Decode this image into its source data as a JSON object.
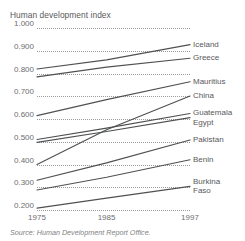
{
  "chart_data": {
    "type": "line",
    "title": "Human development index",
    "xlabel": "",
    "ylabel": "",
    "x": [
      1975,
      1985,
      1997
    ],
    "tick_labels_x": [
      "1975",
      "1985",
      "1997"
    ],
    "tick_labels_y": [
      "1.000",
      "0.900",
      "0.800",
      "0.700",
      "0.600",
      "0.500",
      "0.400",
      "0.300",
      "0.200"
    ],
    "ylim": [
      0.2,
      1.0
    ],
    "xlim": [
      1975,
      1997
    ],
    "grid": "horizontal-dotted",
    "legend_position": "right-inline-labels",
    "line_color": "#4f5052",
    "grid_color": "#9b9b9b",
    "text_color": "#58595b",
    "series": [
      {
        "name": "Iceland",
        "values": [
          0.82,
          0.86,
          0.927
        ]
      },
      {
        "name": "Greece",
        "values": [
          0.785,
          0.828,
          0.867
        ]
      },
      {
        "name": "Mauritius",
        "values": [
          0.615,
          0.685,
          0.764
        ]
      },
      {
        "name": "China",
        "values": [
          0.4,
          0.553,
          0.701
        ]
      },
      {
        "name": "Guatemala",
        "values": [
          0.51,
          0.56,
          0.624
        ]
      },
      {
        "name": "Egypt",
        "values": [
          0.497,
          0.545,
          0.606
        ]
      },
      {
        "name": "Pakistan",
        "values": [
          0.331,
          0.407,
          0.508
        ]
      },
      {
        "name": "Benin",
        "values": [
          0.288,
          0.344,
          0.421
        ]
      },
      {
        "name": "Burkina Faso",
        "values": [
          0.208,
          0.252,
          0.304
        ]
      }
    ]
  },
  "source": {
    "text": "Source: Human Development Report Office."
  },
  "series_labels": [
    {
      "lines": [
        "Iceland"
      ]
    },
    {
      "lines": [
        "Greece"
      ]
    },
    {
      "lines": [
        "Mauritius"
      ]
    },
    {
      "lines": [
        "China"
      ]
    },
    {
      "lines": [
        "Guatemala"
      ]
    },
    {
      "lines": [
        "Egypt"
      ]
    },
    {
      "lines": [
        "Pakistan"
      ]
    },
    {
      "lines": [
        "Benin"
      ]
    },
    {
      "lines": [
        "Burkina",
        "Faso"
      ]
    }
  ]
}
